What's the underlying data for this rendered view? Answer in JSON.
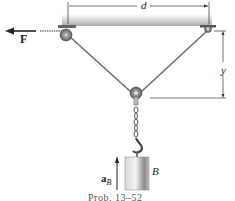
{
  "figure": {
    "caption": "Prob. 13–52",
    "labels": {
      "force": "F",
      "distance": "d",
      "height": "y",
      "block": "B",
      "acceleration_main": "a",
      "acceleration_sub": "B"
    },
    "colors": {
      "ceiling": "#c8c8c8",
      "rope": "#6e6e6e",
      "block_light": "#e6e6e6",
      "block_dark": "#777777",
      "line": "#333333"
    }
  }
}
